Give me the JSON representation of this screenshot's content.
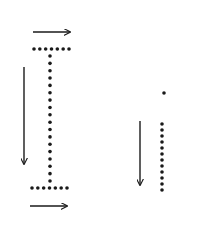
{
  "diagram": {
    "colors": {
      "stroke": "#1a1a1a",
      "background": "#ffffff"
    },
    "letters": [
      {
        "name": "uppercase-I",
        "top_bar": {
          "y": 49,
          "x1": 34,
          "x2": 69,
          "dots": 7
        },
        "stem": {
          "x": 50,
          "y1": 49,
          "y2": 188,
          "dots": 20
        },
        "bottom_bar": {
          "y": 188,
          "x1": 32,
          "x2": 67,
          "dots": 7
        },
        "arrows": [
          {
            "name": "top-right-arrow",
            "x1": 33,
            "y1": 32,
            "x2": 70,
            "y2": 32
          },
          {
            "name": "left-down-arrow",
            "x1": 24,
            "y1": 67,
            "x2": 24,
            "y2": 164
          },
          {
            "name": "bottom-right-arrow",
            "x1": 30,
            "y1": 206,
            "x2": 67,
            "y2": 206
          }
        ]
      },
      {
        "name": "lowercase-i",
        "tittle": {
          "x": 164,
          "y": 93
        },
        "stem": {
          "x": 162,
          "y1": 124,
          "y2": 190,
          "dots": 12
        },
        "arrows": [
          {
            "name": "down-arrow",
            "x1": 140,
            "y1": 121,
            "x2": 140,
            "y2": 185
          }
        ]
      }
    ]
  }
}
